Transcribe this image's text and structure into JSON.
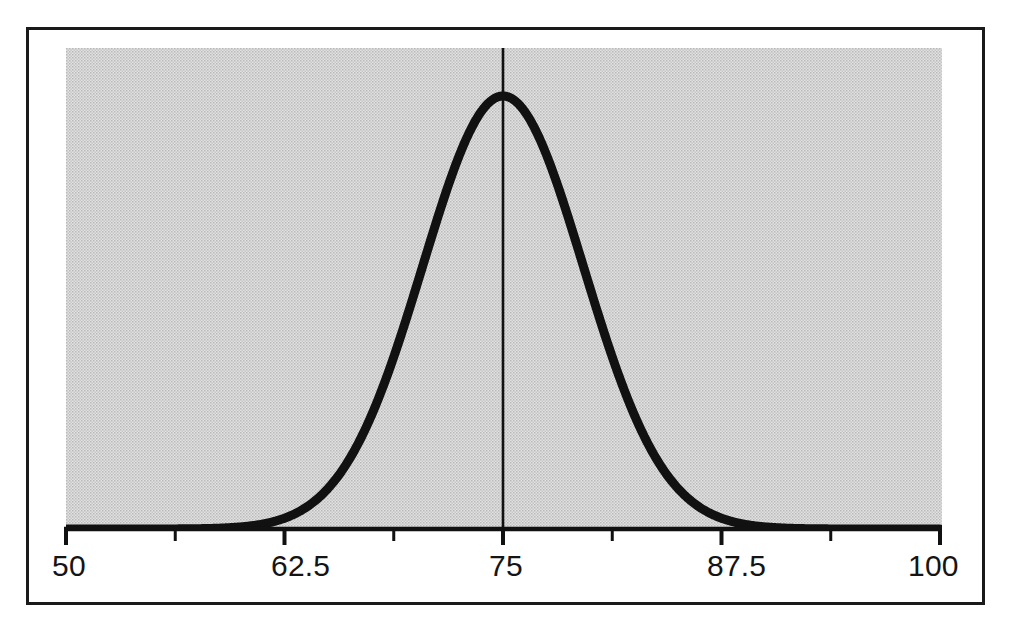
{
  "figure": {
    "background_color": "#ffffff",
    "border_color": "#1a1a1a",
    "plot_fill_color": "#d2d2d2",
    "curve_color": "#111111",
    "axis_color": "#111111",
    "reference_line_color": "#111111"
  },
  "axis": {
    "tick_labels": [
      "50",
      "62.5",
      "75",
      "87.5",
      "100"
    ],
    "all_tick_values": [
      50,
      56.25,
      62.5,
      68.75,
      75,
      81.25,
      87.5,
      93.75,
      100
    ],
    "labelled_tick_values": [
      50,
      62.5,
      75,
      87.5,
      100
    ],
    "min_label": "50",
    "max_label": "100",
    "center_label": "75"
  },
  "annotations": {
    "mean_marker_label": "75",
    "mean_marker_description": "vertical line at mean"
  },
  "chart_data": {
    "type": "line",
    "title": "",
    "subtitle": "",
    "xlabel": "",
    "ylabel": "",
    "xlim": [
      50,
      100
    ],
    "ylim": [
      0,
      1
    ],
    "grid": false,
    "legend": "none",
    "distribution": {
      "name": "normal",
      "mean": 75,
      "std_dev": 4.6,
      "peak_value": 1.0
    },
    "xticks": [
      50,
      56.25,
      62.5,
      68.75,
      75,
      81.25,
      87.5,
      93.75,
      100
    ],
    "xticklabels": [
      "50",
      "",
      "62.5",
      "",
      "75",
      "",
      "87.5",
      "",
      "100"
    ],
    "annotations": [
      {
        "type": "vline",
        "x": 75,
        "label": "75",
        "from_y": 0,
        "to_y": 1.0
      }
    ],
    "x": [
      50,
      51,
      52,
      53,
      54,
      55,
      56,
      57,
      58,
      59,
      60,
      61,
      62,
      63,
      64,
      65,
      66,
      67,
      68,
      69,
      70,
      71,
      72,
      73,
      74,
      75,
      76,
      77,
      78,
      79,
      80,
      81,
      82,
      83,
      84,
      85,
      86,
      87,
      88,
      89,
      90,
      91,
      92,
      93,
      94,
      95,
      96,
      97,
      98,
      99,
      100
    ],
    "y": [
      0.0,
      0.0,
      0.0,
      0.0,
      0.0,
      0.0,
      0.001,
      0.001,
      0.002,
      0.004,
      0.008,
      0.015,
      0.027,
      0.046,
      0.074,
      0.114,
      0.168,
      0.238,
      0.323,
      0.421,
      0.525,
      0.63,
      0.727,
      0.81,
      0.872,
      0.91,
      0.921,
      0.906,
      0.866,
      0.806,
      0.73,
      0.646,
      0.558,
      0.471,
      0.389,
      0.314,
      0.248,
      0.191,
      0.144,
      0.106,
      0.076,
      0.053,
      0.036,
      0.024,
      0.015,
      0.01,
      0.006,
      0.004,
      0.002,
      0.001,
      0.001
    ]
  }
}
